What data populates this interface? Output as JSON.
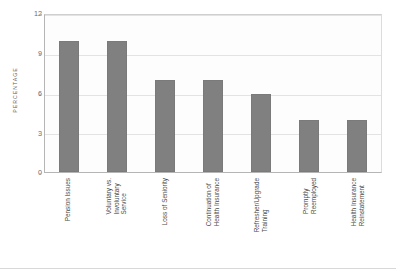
{
  "chart_data": {
    "type": "bar",
    "title": "",
    "xlabel": "",
    "ylabel": "PERCENTAGE",
    "ylim": [
      0,
      12
    ],
    "yticks": [
      0,
      3,
      6,
      9,
      12
    ],
    "grid": true,
    "legend": "none",
    "bar_color": "#808080",
    "plot_background": "#fdfdfd",
    "categories": [
      "Pension Issues",
      "Voluntary vs. Involuntary Service",
      "Loss of Seniority",
      "Continuation of Health Insurance",
      "Refresher/Upgrade Training",
      "Promptly Reemployed",
      "Health Insurance Reinstatement"
    ],
    "category_lines": [
      [
        "Pension Issues"
      ],
      [
        "Voluntary vs.",
        "Involuntary",
        "Service"
      ],
      [
        "Loss of Seniority"
      ],
      [
        "Continuation of",
        "Health Insurance"
      ],
      [
        "Refresher/Upgrade",
        "Training"
      ],
      [
        "Promptly",
        "Reemployed"
      ],
      [
        "Health Insurance",
        "Reinstatement"
      ]
    ],
    "values": [
      10,
      10,
      7,
      7,
      6,
      4,
      4
    ]
  }
}
